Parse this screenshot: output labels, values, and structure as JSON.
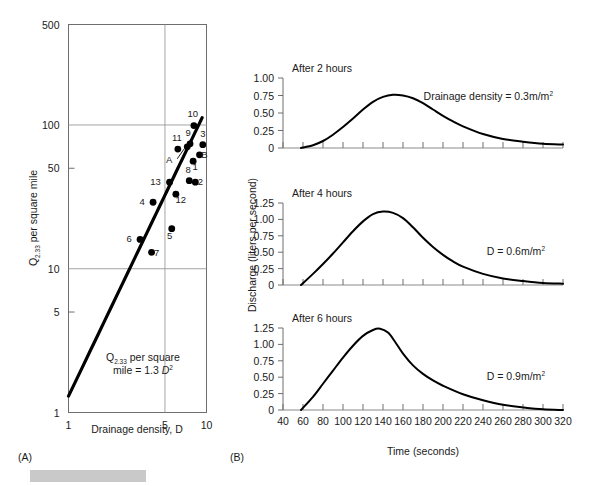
{
  "panel_a": {
    "letter": "(A)",
    "xlabel": "Drainage density, D",
    "ylabel_main": "Q",
    "ylabel_sub": "2.33",
    "ylabel_rest": " per square mile",
    "annotation_line1_main": "Q",
    "annotation_line1_sub": "2.33",
    "annotation_line1_rest": " per square",
    "annotation_line2_pre": "mile = 1.3 ",
    "annotation_line2_var": "D",
    "annotation_line2_exp": "2",
    "x_ticks": [
      "1",
      "5",
      "10"
    ],
    "y_ticks": [
      "500",
      "100",
      "50",
      "10",
      "5",
      "1"
    ]
  },
  "panel_b": {
    "letter": "(B)",
    "xlabel": "Time (seconds)",
    "ylabel": "Discharge (liters per second)",
    "x_ticks": [
      "40",
      "60",
      "80",
      "100",
      "120",
      "140",
      "160",
      "180",
      "200",
      "220",
      "240",
      "260",
      "280",
      "300",
      "320"
    ],
    "subplots": [
      {
        "title": "After 2 hours",
        "series_label_pre": "Drainage density = 0.3m/m",
        "series_label_exp": "2",
        "y_ticks": [
          "1.00",
          "0.75",
          "0.50",
          "0.25",
          "0"
        ]
      },
      {
        "title": "After 4 hours",
        "series_label_pre": "D = 0.6m/m",
        "series_label_exp": "2",
        "y_ticks": [
          "1.25",
          "1.00",
          "0.75",
          "0.50",
          "0.25",
          "0"
        ]
      },
      {
        "title": "After 6 hours",
        "series_label_pre": "D = 0.9m/m",
        "series_label_exp": "2",
        "y_ticks": [
          "1.25",
          "1.00",
          "0.75",
          "0.50",
          "0.25",
          "0"
        ]
      }
    ]
  },
  "chart_data": [
    {
      "type": "scatter",
      "id": "panel-a-scatter",
      "title": "",
      "xlabel": "Drainage density, D",
      "ylabel": "Q2.33 per square mile",
      "xscale": "log",
      "yscale": "log",
      "xlim": [
        1,
        10
      ],
      "ylim": [
        1,
        500
      ],
      "xticks": [
        1,
        5,
        10
      ],
      "yticks": [
        1,
        5,
        10,
        50,
        100,
        500
      ],
      "grid": true,
      "gridlines_x": [
        5
      ],
      "gridlines_y": [
        10,
        100
      ],
      "annotation": "Q2.33 per square mile = 1.3 D^2",
      "fit_line": {
        "formula": "y = 1.3 * x^2",
        "x_from": 1.0,
        "x_to": 9.3
      },
      "points": [
        {
          "label": "10",
          "x": 8.1,
          "y": 99,
          "label_dx": -1,
          "label_dy": -9
        },
        {
          "label": "9",
          "x": 7.6,
          "y": 74,
          "label_dx": -2,
          "label_dy": -8
        },
        {
          "label": "3",
          "x": 9.4,
          "y": 73,
          "label_dx": 0,
          "label_dy": -8
        },
        {
          "label": "11",
          "x": 6.2,
          "y": 68,
          "label_dx": -1,
          "label_dy": -8
        },
        {
          "label": "B",
          "x": 8.9,
          "y": 62,
          "label_dx": 5,
          "label_dy": 3
        },
        {
          "label": "A",
          "x": 7.25,
          "y": 70.5,
          "label_dx": -18,
          "label_dy": 16,
          "leader": true
        },
        {
          "label": "1",
          "x": 8.0,
          "y": 56,
          "label_dx": 2,
          "label_dy": 9
        },
        {
          "label": "8",
          "x": 7.5,
          "y": 41,
          "label_dx": -1,
          "label_dy": -8
        },
        {
          "label": "2",
          "x": 8.3,
          "y": 40,
          "label_dx": 5,
          "label_dy": 3
        },
        {
          "label": "13",
          "x": 5.4,
          "y": 40,
          "label_dx": -14,
          "label_dy": 3
        },
        {
          "label": "12",
          "x": 6.0,
          "y": 33,
          "label_dx": 5,
          "label_dy": 9
        },
        {
          "label": "4",
          "x": 4.1,
          "y": 29,
          "label_dx": -11,
          "label_dy": 3
        },
        {
          "label": "5",
          "x": 5.6,
          "y": 19,
          "label_dx": -2,
          "label_dy": 10
        },
        {
          "label": "6",
          "x": 3.3,
          "y": 16,
          "label_dx": -11,
          "label_dy": 3
        },
        {
          "label": "7",
          "x": 4.0,
          "y": 13,
          "label_dx": 5,
          "label_dy": 4
        }
      ]
    },
    {
      "type": "line",
      "id": "hydrograph-2h",
      "title": "After 2 hours",
      "xlabel": "Time (seconds)",
      "ylabel": "Discharge (liters per second)",
      "xlim": [
        40,
        320
      ],
      "ylim": [
        0,
        1.0
      ],
      "yticks": [
        0,
        0.25,
        0.5,
        0.75,
        1.0
      ],
      "annotation": "Drainage density = 0.3m/m2",
      "peak": {
        "x": 150,
        "y": 0.76
      },
      "x": [
        58,
        70,
        80,
        90,
        100,
        110,
        120,
        130,
        140,
        150,
        160,
        170,
        180,
        190,
        200,
        210,
        220,
        240,
        260,
        280,
        300,
        320
      ],
      "y": [
        0.0,
        0.04,
        0.1,
        0.19,
        0.3,
        0.42,
        0.55,
        0.66,
        0.73,
        0.76,
        0.75,
        0.71,
        0.64,
        0.55,
        0.46,
        0.38,
        0.31,
        0.2,
        0.13,
        0.09,
        0.06,
        0.05
      ]
    },
    {
      "type": "line",
      "id": "hydrograph-4h",
      "title": "After 4 hours",
      "xlabel": "Time (seconds)",
      "ylabel": "Discharge (liters per second)",
      "xlim": [
        40,
        320
      ],
      "ylim": [
        0,
        1.25
      ],
      "yticks": [
        0,
        0.25,
        0.5,
        0.75,
        1.0,
        1.25
      ],
      "annotation": "D = 0.6m/m2",
      "peak": {
        "x": 140,
        "y": 1.12
      },
      "x": [
        58,
        70,
        80,
        90,
        100,
        110,
        120,
        130,
        140,
        150,
        160,
        170,
        180,
        190,
        200,
        210,
        220,
        240,
        260,
        280,
        300,
        320
      ],
      "y": [
        0.0,
        0.17,
        0.32,
        0.48,
        0.65,
        0.82,
        0.97,
        1.08,
        1.12,
        1.1,
        1.02,
        0.88,
        0.72,
        0.58,
        0.46,
        0.36,
        0.28,
        0.17,
        0.1,
        0.06,
        0.03,
        0.02
      ]
    },
    {
      "type": "line",
      "id": "hydrograph-6h",
      "title": "After 6 hours",
      "xlabel": "Time (seconds)",
      "ylabel": "Discharge (liters per second)",
      "xlim": [
        40,
        320
      ],
      "ylim": [
        0,
        1.25
      ],
      "yticks": [
        0,
        0.25,
        0.5,
        0.75,
        1.0,
        1.25
      ],
      "annotation": "D = 0.9m/m2",
      "peak": {
        "x": 137,
        "y": 1.24
      },
      "x": [
        58,
        70,
        80,
        90,
        100,
        110,
        120,
        130,
        137,
        145,
        152,
        160,
        170,
        180,
        190,
        200,
        220,
        240,
        260,
        280,
        300,
        320
      ],
      "y": [
        0.0,
        0.2,
        0.4,
        0.6,
        0.8,
        0.98,
        1.13,
        1.22,
        1.24,
        1.18,
        1.04,
        0.86,
        0.68,
        0.55,
        0.45,
        0.37,
        0.24,
        0.15,
        0.08,
        0.04,
        0.01,
        0.0
      ]
    }
  ]
}
